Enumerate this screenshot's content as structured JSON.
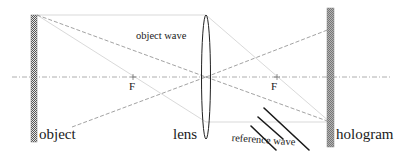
{
  "diagram": {
    "type": "optics-holography-setup",
    "labels": {
      "object": "object",
      "lens": "lens",
      "hologram": "hologram",
      "object_wave": "object wave",
      "reference_wave": "reference wave",
      "focal_left": "F",
      "focal_right": "F"
    },
    "colors": {
      "ink": "#1a1a1a",
      "ray_light": "#c8c8c8",
      "ray_dashed": "#8a8a8a",
      "axis": "#9a9a9a",
      "object_plate": "#6e6e6e",
      "hologram_plate": "#8c8c8c",
      "reference_lines": "#1a1a1a"
    },
    "elements": [
      {
        "name": "object",
        "kind": "plate",
        "x": 34,
        "y_top": 15,
        "y_bottom": 142
      },
      {
        "name": "lens",
        "kind": "biconvex-lens",
        "cx": 206,
        "y_top": 15,
        "y_bottom": 138
      },
      {
        "name": "hologram",
        "kind": "plate",
        "x": 330,
        "y_top": 8,
        "y_bottom": 147
      },
      {
        "name": "focal-left",
        "kind": "focal-point",
        "x": 133,
        "y": 77
      },
      {
        "name": "focal-right",
        "kind": "focal-point",
        "x": 277,
        "y": 77
      },
      {
        "name": "optical-axis",
        "kind": "axis",
        "y": 77,
        "x_start": 12,
        "x_end": 392
      }
    ]
  }
}
